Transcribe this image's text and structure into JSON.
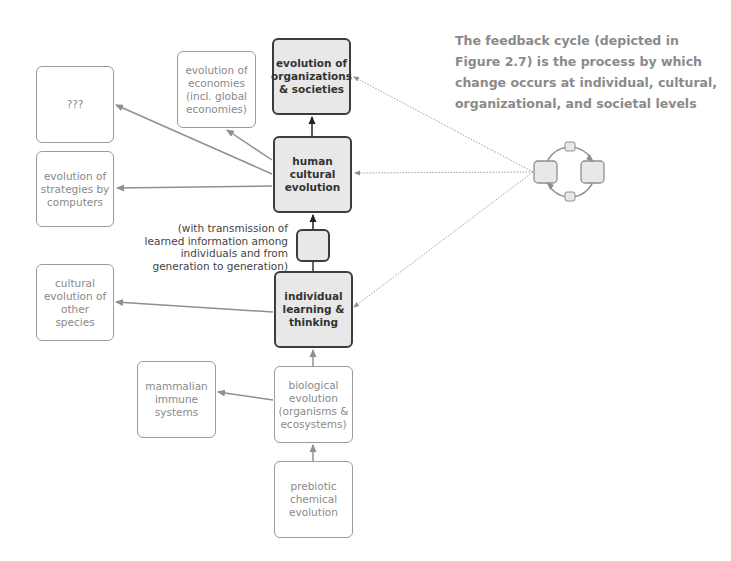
{
  "caption": {
    "lines": [
      "The feedback cycle (depicted in",
      "Figure 2.7) is the process by which",
      "change occurs at individual, cultural,",
      "organizational, and societal levels"
    ]
  },
  "nodes": {
    "organizations": {
      "lines": [
        "evolution of",
        "organizations",
        "& societies"
      ]
    },
    "human_cultural": {
      "lines": [
        "human",
        "cultural",
        "evolution"
      ]
    },
    "transmission_box": {
      "lines": []
    },
    "individual": {
      "lines": [
        "individual",
        "learning &",
        "thinking"
      ]
    },
    "biological": {
      "lines": [
        "biological",
        "evolution",
        "(organisms &",
        "ecosystems)"
      ]
    },
    "prebiotic": {
      "lines": [
        "prebiotic",
        "chemical",
        "evolution"
      ]
    },
    "economies": {
      "lines": [
        "evolution of",
        "economies",
        "(incl. global",
        "economies)"
      ]
    },
    "unknown": {
      "lines": [
        "???"
      ]
    },
    "strategies": {
      "lines": [
        "evolution of",
        "strategies by",
        "computers"
      ]
    },
    "other_species": {
      "lines": [
        "cultural",
        "evolution of",
        "other",
        "species"
      ]
    },
    "immune": {
      "lines": [
        "mammalian",
        "immune",
        "systems"
      ]
    }
  },
  "transmission_note": {
    "lines": [
      "(with transmission of",
      "learned information among",
      "individuals and from",
      "generation to generation)"
    ]
  },
  "colors": {
    "dark_border": "#3c3c3c",
    "dark_fill": "#e8e8e8",
    "light_border": "#9c9c9c",
    "light_text": "#8a8a8a",
    "arrow_gray": "#8f8f8f"
  }
}
